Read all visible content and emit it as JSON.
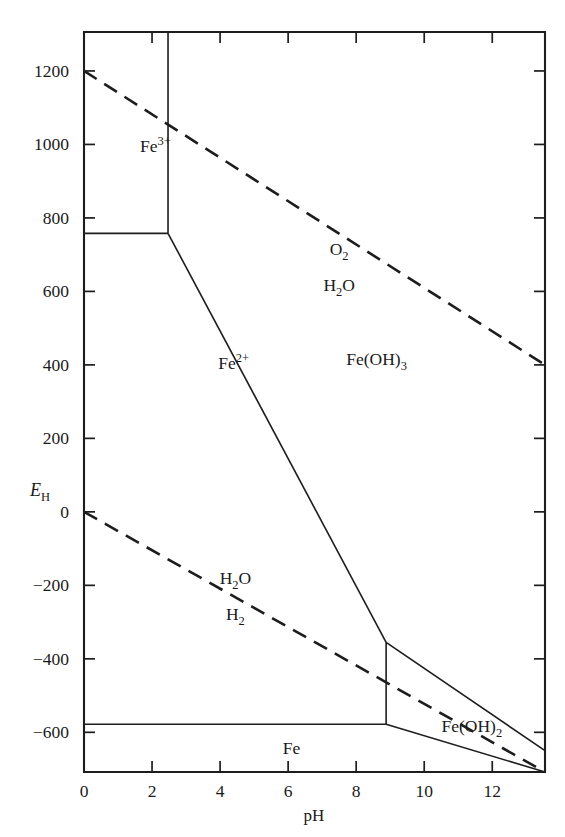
{
  "figure": {
    "kind": "pourbaix-diagram",
    "system": "Fe"
  },
  "axes": {
    "x": {
      "label": "pH",
      "ticks": [
        "0",
        "2",
        "4",
        "6",
        "8",
        "10",
        "12"
      ],
      "tick_values": [
        0,
        2,
        4,
        6,
        8,
        10,
        12
      ],
      "range": [
        0,
        13.55
      ]
    },
    "y": {
      "label_main": "E",
      "label_sub": "H",
      "ticks": [
        "1200",
        "1000",
        "800",
        "600",
        "400",
        "200",
        "0",
        "−200",
        "−400",
        "−600"
      ],
      "tick_values": [
        1200,
        1000,
        800,
        600,
        400,
        200,
        0,
        -200,
        -400,
        -600
      ],
      "range": [
        -708,
        1306
      ]
    }
  },
  "phase_labels": [
    {
      "name": "ferric-ion",
      "base": "Fe",
      "sup": "3+",
      "sub": "",
      "x": 2.1,
      "y": 980
    },
    {
      "name": "ferrous-ion",
      "base": "Fe",
      "sup": "2+",
      "sub": "",
      "x": 4.4,
      "y": 390
    },
    {
      "name": "ferric-hydroxide",
      "base": "Fe(OH)",
      "sup": "",
      "sub": "3",
      "x": 8.6,
      "y": 400
    },
    {
      "name": "ferrous-hydroxide",
      "base": "Fe(OH)",
      "sup": "",
      "sub": "2",
      "x": 11.4,
      "y": -600
    },
    {
      "name": "iron-metal",
      "base": "Fe",
      "sup": "",
      "sub": "",
      "x": 6.1,
      "y": -660
    }
  ],
  "stability_labels": [
    {
      "name": "oxygen",
      "base": "O",
      "sub": "2",
      "x": 7.5,
      "y": 700
    },
    {
      "name": "water-upper",
      "base": "H",
      "sub": "2",
      "tail": "O",
      "x": 7.5,
      "y": 600
    },
    {
      "name": "water-lower",
      "base": "H",
      "sub": "2",
      "tail": "O",
      "x": 4.45,
      "y": -195
    },
    {
      "name": "hydrogen",
      "base": "H",
      "sub": "2",
      "x": 4.45,
      "y": -295
    }
  ],
  "chart_data": {
    "type": "line",
    "title": "",
    "xlabel": "pH",
    "ylabel": "E_H",
    "xlim": [
      0,
      13.55
    ],
    "ylim": [
      -708,
      1306
    ],
    "grid": false,
    "legend": "none",
    "units": {
      "x": "pH",
      "y": "mV"
    },
    "series": [
      {
        "name": "Fe3+/Fe2+ boundary (horizontal)",
        "style": "solid",
        "points": [
          [
            0,
            758
          ],
          [
            2.47,
            758
          ]
        ]
      },
      {
        "name": "Fe3+/Fe(OH)3 boundary (vertical)",
        "style": "solid",
        "points": [
          [
            2.47,
            1306
          ],
          [
            2.47,
            758
          ]
        ]
      },
      {
        "name": "Fe2+/Fe(OH)3 boundary (sloping)",
        "style": "solid",
        "points": [
          [
            2.47,
            758
          ],
          [
            8.88,
            -355
          ]
        ]
      },
      {
        "name": "Fe2+/Fe boundary (vertical at pH 8.88)",
        "style": "solid",
        "points": [
          [
            8.88,
            -355
          ],
          [
            8.88,
            -578
          ]
        ]
      },
      {
        "name": "Fe2+/Fe boundary (horizontal)",
        "style": "solid",
        "points": [
          [
            0,
            -578
          ],
          [
            8.88,
            -578
          ]
        ]
      },
      {
        "name": "Fe(OH)3/Fe(OH)2 boundary",
        "style": "solid",
        "points": [
          [
            8.88,
            -355
          ],
          [
            13.55,
            -650
          ]
        ]
      },
      {
        "name": "Fe(OH)2/Fe boundary",
        "style": "solid",
        "points": [
          [
            8.88,
            -578
          ],
          [
            13.55,
            -708
          ]
        ]
      },
      {
        "name": "O2/H2O stability limit",
        "style": "dashed",
        "points": [
          [
            0,
            1200
          ],
          [
            13.55,
            400
          ]
        ]
      },
      {
        "name": "H2O/H2 stability limit",
        "style": "dashed",
        "points": [
          [
            0,
            0
          ],
          [
            13.55,
            -708
          ]
        ]
      }
    ]
  }
}
